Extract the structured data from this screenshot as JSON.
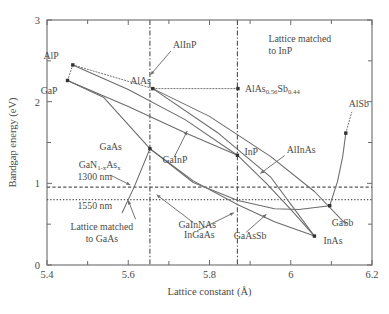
{
  "chart_data": {
    "type": "scatter",
    "title": "",
    "xlabel": "Lattice constant (Å)",
    "ylabel": "Bandgap energy (eV)",
    "xlim": [
      5.4,
      6.2
    ],
    "ylim": [
      0,
      3
    ],
    "xticks": [
      5.4,
      5.6,
      5.8,
      6.0,
      6.2
    ],
    "xtick_labels": [
      "5.4",
      "5.6",
      "5.8",
      "6",
      "6.2"
    ],
    "xminor_ticks": [
      5.5,
      5.7,
      5.9,
      6.1
    ],
    "yticks": [
      0,
      1,
      2,
      3
    ],
    "ytick_labels": [
      "0",
      "1",
      "2",
      "3"
    ],
    "yminor_ticks": [
      0.5,
      1.5,
      2.5
    ],
    "grid": false,
    "legend": "none",
    "points": [
      {
        "name": "AlP",
        "label": "AlP",
        "x": 5.4635,
        "y": 2.45,
        "label_dx": -14,
        "label_dy": -6
      },
      {
        "name": "GaP",
        "label": "GaP",
        "x": 5.4505,
        "y": 2.26,
        "label_dx": -10,
        "label_dy": 14
      },
      {
        "name": "AlAs",
        "label": "AlAs",
        "x": 5.6605,
        "y": 2.16,
        "label_dx": -2,
        "label_dy": -5
      },
      {
        "name": "GaAs",
        "label": "GaAs",
        "x": 5.6533,
        "y": 1.424,
        "label_dx": -28,
        "label_dy": 1
      },
      {
        "name": "InP",
        "label": "InP",
        "x": 5.8687,
        "y": 1.344,
        "label_dx": 7,
        "label_dy": 0
      },
      {
        "name": "AlAsSb",
        "label": "AlAs",
        "x": 5.87,
        "y": 2.16,
        "label_dx": 7,
        "label_dy": 3
      },
      {
        "name": "InAs",
        "label": "InAs",
        "x": 6.0583,
        "y": 0.354,
        "label_dx": 9,
        "label_dy": 8
      },
      {
        "name": "GaSb",
        "label": "GaSb",
        "x": 6.0959,
        "y": 0.726,
        "label_dx": 2,
        "label_dy": 20
      },
      {
        "name": "AlSb",
        "label": "AlSb",
        "x": 6.1355,
        "y": 1.615,
        "label_dx": 3,
        "label_dy": -26
      }
    ],
    "annotations": [
      {
        "name": "AlInP",
        "text": "AlInP"
      },
      {
        "name": "GaInP",
        "text": "GaInP"
      },
      {
        "name": "AlInAs",
        "text": "AlInAs"
      },
      {
        "name": "GaInNAs",
        "text": "GaInNAs"
      },
      {
        "name": "InGaAs",
        "text": "InGaAs"
      },
      {
        "name": "GaAsSb",
        "text": "GaAsSb"
      },
      {
        "name": "GaNAs",
        "text": "GaN1-xAsx"
      }
    ],
    "reference_lines": [
      {
        "name": "1300 nm",
        "orientation": "horizontal",
        "value": 0.954,
        "style": "dashed",
        "label": "1300 nm"
      },
      {
        "name": "1550 nm",
        "orientation": "horizontal",
        "value": 0.8,
        "style": "dotted",
        "label": "1550 nm"
      },
      {
        "name": "Lattice matched to GaAs",
        "orientation": "vertical",
        "value": 5.6533,
        "style": "dash-dot",
        "label": "Lattice matched to GaAs"
      },
      {
        "name": "Lattice matched to InP",
        "orientation": "vertical",
        "value": 5.8687,
        "style": "dash-dot",
        "label": "Lattice matched to InP"
      }
    ],
    "curves": [
      {
        "name": "AlP-AlAs",
        "style": "dotted",
        "points": [
          [
            5.4635,
            2.45
          ],
          [
            5.6605,
            2.16
          ]
        ]
      },
      {
        "name": "AlP-GaP",
        "style": "dotted",
        "points": [
          [
            5.4635,
            2.45
          ],
          [
            5.4505,
            2.26
          ]
        ]
      },
      {
        "name": "AlAs-AlAsSb",
        "style": "dotted",
        "points": [
          [
            5.6605,
            2.16
          ],
          [
            5.87,
            2.16
          ]
        ]
      },
      {
        "name": "GaP-GaAs",
        "style": "solid",
        "points": [
          [
            5.4505,
            2.26
          ],
          [
            5.54,
            2.05
          ],
          [
            5.6533,
            1.424
          ]
        ]
      },
      {
        "name": "AlP-InP",
        "style": "solid",
        "points": [
          [
            5.4635,
            2.45
          ],
          [
            5.6,
            2.15
          ],
          [
            5.74,
            1.78
          ],
          [
            5.8687,
            1.344
          ]
        ]
      },
      {
        "name": "GaP-InP",
        "style": "solid",
        "points": [
          [
            5.4505,
            2.26
          ],
          [
            5.6,
            1.94
          ],
          [
            5.74,
            1.62
          ],
          [
            5.8687,
            1.344
          ]
        ]
      },
      {
        "name": "AlAs-AlSb",
        "style": "solid",
        "points": [
          [
            5.6605,
            2.16
          ],
          [
            5.8,
            1.82
          ],
          [
            5.95,
            1.33
          ],
          [
            6.0583,
            0.9
          ],
          [
            6.1355,
            0.5
          ]
        ]
      },
      {
        "name": "AlAs-InAs",
        "style": "solid",
        "points": [
          [
            5.6605,
            2.16
          ],
          [
            5.82,
            1.62
          ],
          [
            5.95,
            1.08
          ],
          [
            6.0583,
            0.354
          ]
        ]
      },
      {
        "name": "GaAs-InAs",
        "style": "solid",
        "points": [
          [
            5.6533,
            1.424
          ],
          [
            5.76,
            1.03
          ],
          [
            5.8687,
            0.74
          ],
          [
            5.96,
            0.53
          ],
          [
            6.0583,
            0.354
          ]
        ]
      },
      {
        "name": "InP-InAs",
        "style": "solid",
        "points": [
          [
            5.8687,
            1.344
          ],
          [
            5.94,
            1.0
          ],
          [
            6.0,
            0.68
          ],
          [
            6.0583,
            0.354
          ]
        ]
      },
      {
        "name": "GaAs-GaSb",
        "style": "solid",
        "points": [
          [
            5.6533,
            1.424
          ],
          [
            5.76,
            1.01
          ],
          [
            5.87,
            0.79
          ],
          [
            5.96,
            0.69
          ],
          [
            6.02,
            0.68
          ],
          [
            6.0959,
            0.726
          ]
        ]
      },
      {
        "name": "GaSb-AlSb",
        "style": "solid",
        "points": [
          [
            6.0959,
            0.726
          ],
          [
            6.115,
            1.02
          ],
          [
            6.128,
            1.33
          ],
          [
            6.1355,
            1.615
          ]
        ]
      },
      {
        "name": "AlSb-leader",
        "style": "dotted",
        "points": [
          [
            6.1355,
            1.615
          ],
          [
            6.15,
            1.87
          ]
        ]
      },
      {
        "name": "GaAs-GaNAs",
        "style": "solid",
        "points": [
          [
            5.6533,
            1.424
          ],
          [
            5.615,
            0.96
          ],
          [
            5.585,
            0.64
          ]
        ]
      }
    ],
    "leader_lines": [
      {
        "name": "AlInP-leader",
        "from": [
          5.705,
          2.62
        ],
        "to": [
          5.655,
          2.33
        ]
      },
      {
        "name": "GaInP-leader",
        "from": [
          5.713,
          1.32
        ],
        "to": [
          5.745,
          1.64
        ]
      },
      {
        "name": "AlInAs-leader",
        "from": [
          5.985,
          1.34
        ],
        "to": [
          5.925,
          1.12
        ]
      },
      {
        "name": "GaNAs-leader",
        "from": [
          5.556,
          1.1
        ],
        "to": [
          5.605,
          0.98
        ]
      },
      {
        "name": "GaNAs-leader2",
        "from": [
          5.618,
          0.56
        ],
        "to": [
          5.6,
          0.79
        ]
      },
      {
        "name": "GaInNAs-leader",
        "from": [
          5.76,
          0.52
        ],
        "to": [
          5.67,
          0.86
        ]
      },
      {
        "name": "InGaAs-leader",
        "from": [
          5.77,
          0.42
        ],
        "to": [
          5.86,
          0.64
        ]
      },
      {
        "name": "GaAsSb-leader",
        "from": [
          5.89,
          0.4
        ],
        "to": [
          5.94,
          0.62
        ]
      }
    ]
  },
  "caption": ""
}
